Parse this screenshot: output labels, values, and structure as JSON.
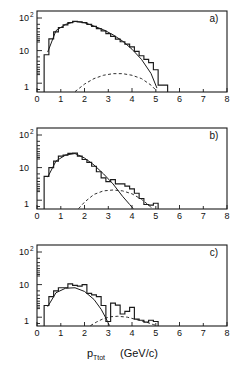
{
  "figure": {
    "xlabel_symbol": "p",
    "xlabel_subscript": "Ttot",
    "xlabel_units": "(GeV/c)",
    "panel_labels": [
      "a)",
      "b)",
      "c)"
    ],
    "x_ticks": [
      "0",
      "1",
      "2",
      "3",
      "4",
      "5",
      "6",
      "7",
      "8"
    ],
    "y_tick_labels": [
      "10",
      "10",
      "1"
    ],
    "y_tick_exponents": [
      "2",
      "",
      ""
    ],
    "line_color": "#1a1a1a",
    "background": "#ffffff"
  },
  "chart_data": [
    {
      "type": "bar",
      "title": "a)",
      "xlabel": "p_Ttot (GeV/c)",
      "ylabel": "counts",
      "xlim": [
        0,
        8
      ],
      "ylim": [
        0.7,
        400
      ],
      "yscale": "log",
      "grid": false,
      "legend": null,
      "bin_width": 0.2,
      "x": [
        0.4,
        0.6,
        0.8,
        1.0,
        1.2,
        1.4,
        1.6,
        1.8,
        2.0,
        2.2,
        2.4,
        2.6,
        2.8,
        3.0,
        3.2,
        3.4,
        3.6,
        3.8,
        4.0,
        4.2,
        4.4,
        4.6,
        4.8,
        5.0,
        5.2,
        5.4
      ],
      "values": [
        13,
        45,
        78,
        110,
        135,
        160,
        178,
        172,
        160,
        140,
        120,
        100,
        84,
        68,
        55,
        44,
        36,
        30,
        24,
        17,
        12,
        9,
        7,
        4,
        1.2,
        1.2
      ],
      "fit_solid": {
        "name": "signal fit",
        "x": [
          0.45,
          0.8,
          1.2,
          1.6,
          2.0,
          2.4,
          2.8,
          3.2,
          3.6,
          4.0,
          4.4,
          4.8,
          5.05
        ],
        "y": [
          16,
          86,
          140,
          176,
          160,
          122,
          92,
          62,
          38,
          20,
          9,
          3,
          0.95
        ]
      },
      "fit_dashed": {
        "name": "background",
        "x": [
          1.6,
          2.0,
          2.4,
          2.8,
          3.2,
          3.6,
          4.0,
          4.4,
          4.8,
          5.05
        ],
        "y": [
          0.72,
          1.3,
          2.0,
          2.6,
          2.95,
          2.95,
          2.6,
          2.0,
          1.2,
          0.75
        ]
      }
    },
    {
      "type": "bar",
      "title": "b)",
      "xlabel": "p_Ttot (GeV/c)",
      "ylabel": "counts",
      "xlim": [
        0,
        8
      ],
      "ylim": [
        0.7,
        400
      ],
      "yscale": "log",
      "grid": false,
      "legend": null,
      "bin_width": 0.2,
      "x": [
        0.4,
        0.6,
        0.8,
        1.0,
        1.2,
        1.4,
        1.6,
        1.8,
        2.0,
        2.2,
        2.4,
        2.6,
        2.8,
        3.0,
        3.2,
        3.4,
        3.6,
        3.8,
        4.0,
        4.2,
        4.4,
        4.6,
        4.8,
        5.0
      ],
      "values": [
        9,
        18,
        30,
        44,
        48,
        55,
        56,
        44,
        34,
        27,
        20,
        13,
        8,
        6,
        7,
        5,
        5,
        4.2,
        3.4,
        2.4,
        1.6,
        1.0,
        0.95,
        1.1
      ],
      "fit_solid": {
        "name": "signal fit",
        "x": [
          0.45,
          0.8,
          1.2,
          1.6,
          2.0,
          2.4,
          2.8,
          3.2,
          3.6,
          3.9,
          4.05
        ],
        "y": [
          8.5,
          30,
          48,
          54,
          38,
          22,
          11,
          5,
          1.9,
          1.0,
          0.72
        ]
      },
      "fit_dashed": {
        "name": "background",
        "x": [
          1.75,
          2.0,
          2.4,
          2.8,
          3.2,
          3.6,
          4.0,
          4.4,
          4.7,
          4.85
        ],
        "y": [
          0.72,
          1.2,
          2.2,
          2.9,
          3.1,
          2.9,
          2.3,
          1.5,
          0.95,
          0.72
        ]
      }
    },
    {
      "type": "bar",
      "title": "c)",
      "xlabel": "p_Ttot (GeV/c)",
      "ylabel": "counts",
      "xlim": [
        0,
        8
      ],
      "ylim": [
        0.7,
        400
      ],
      "yscale": "log",
      "grid": false,
      "legend": null,
      "bin_width": 0.2,
      "x": [
        0.4,
        0.6,
        0.8,
        1.0,
        1.2,
        1.4,
        1.6,
        1.8,
        2.0,
        2.2,
        2.4,
        2.6,
        2.8,
        3.0,
        3.2,
        3.4,
        3.6,
        3.8,
        4.0,
        4.2,
        4.4,
        4.6,
        4.8,
        5.0
      ],
      "values": [
        3.5,
        7,
        11,
        14,
        14,
        19,
        17,
        16,
        18,
        9,
        8,
        7,
        3.5,
        1.0,
        4.2,
        3.6,
        1.8,
        2.2,
        3.0,
        1.2,
        1.1,
        0.95,
        1.1,
        1.0
      ],
      "fit_solid": {
        "name": "signal fit",
        "x": [
          0.45,
          0.8,
          1.2,
          1.6,
          2.0,
          2.4,
          2.7,
          2.9,
          3.05
        ],
        "y": [
          3.2,
          9.5,
          13.5,
          14,
          10.5,
          5.6,
          2.6,
          1.3,
          0.72
        ]
      },
      "fit_dashed": {
        "name": "background",
        "x": [
          2.25,
          2.5,
          2.8,
          3.1,
          3.4,
          3.8,
          4.2,
          4.6,
          4.9,
          5.05
        ],
        "y": [
          0.72,
          0.95,
          1.25,
          1.45,
          1.5,
          1.4,
          1.15,
          0.95,
          0.78,
          0.72
        ]
      }
    }
  ]
}
